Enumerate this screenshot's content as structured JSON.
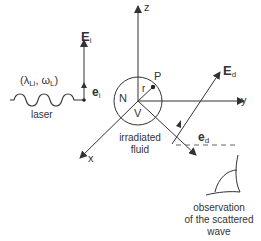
{
  "axes": {
    "z": "z",
    "y": "y",
    "x": "x"
  },
  "incident": {
    "field_label": "E",
    "field_sub": "i",
    "unit_vector_label": "e",
    "unit_vector_sub": "i",
    "params_open": "(λ",
    "params_lambda_sub": "Li",
    "params_mid": ", ω",
    "params_omega_sub": "L",
    "params_close": ")",
    "source_label": "laser"
  },
  "volume": {
    "n_label": "N",
    "v_label": "V",
    "r_label": "r",
    "point_label": "P",
    "caption_line1": "irradiated",
    "caption_line2": "fluid"
  },
  "scattered": {
    "field_label": "E",
    "field_sub": "d",
    "unit_vector_label": "e",
    "unit_vector_sub": "d"
  },
  "observer": {
    "caption_line1": "observation",
    "caption_line2": "of the scattered",
    "caption_line3": "wave"
  },
  "colors": {
    "line": "#333333",
    "dashed": "#666666",
    "background": "#ffffff"
  }
}
